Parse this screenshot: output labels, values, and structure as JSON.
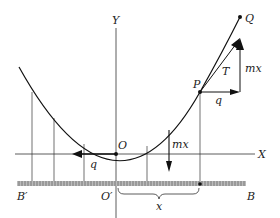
{
  "labels": {
    "Y": "Y",
    "X": "X",
    "Q": "Q",
    "P": "P",
    "T": "T",
    "mx_top": "mx",
    "q_top": "q",
    "O": "O",
    "mx_bottom": "mx",
    "q_bottom": "q",
    "B_prime": "B′",
    "O_prime": "O′",
    "x": "x",
    "B": "B"
  }
}
